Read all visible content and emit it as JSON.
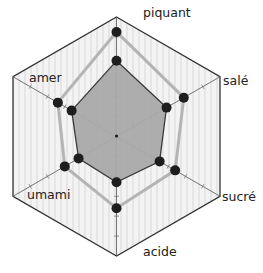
{
  "chart_data": {
    "type": "radar",
    "title": "",
    "categories": [
      "piquant",
      "salé",
      "sucré",
      "acide",
      "umami",
      "amer"
    ],
    "series": [
      {
        "name": "outer",
        "values": [
          5.25,
          3.9,
          3.4,
          3.6,
          3.0,
          3.4
        ],
        "style": "line",
        "line_color": "#b4b4b4",
        "marker_color": "#1e1e1e"
      },
      {
        "name": "inner",
        "values": [
          3.8,
          2.9,
          2.5,
          2.3,
          2.2,
          2.6
        ],
        "style": "filled",
        "fill_color": "#a9a9a9",
        "line_color": "#3a3a3a",
        "marker_color": "#1e1e1e"
      }
    ],
    "rlim": [
      0,
      6
    ],
    "ticks_per_axis": 6,
    "grid": "hexagon",
    "legend": "none"
  },
  "colors": {
    "frame": "#333333",
    "background": "#f1f1f1",
    "axis": "#555555",
    "label": "#222222"
  }
}
